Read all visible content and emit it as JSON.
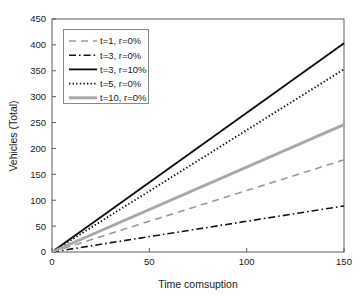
{
  "chart_data": {
    "type": "line",
    "title": "",
    "xlabel": "Time comsuption",
    "ylabel": "Vehicles (Total)",
    "xlim": [
      0,
      150
    ],
    "ylim": [
      0,
      450
    ],
    "xticks": [
      0,
      50,
      100,
      150
    ],
    "yticks": [
      0,
      50,
      100,
      150,
      200,
      250,
      300,
      350,
      400,
      450
    ],
    "xtick_labels": [
      "0",
      "50",
      "100",
      "150"
    ],
    "ytick_labels": [
      "0",
      "50",
      "100",
      "150",
      "200",
      "250",
      "300",
      "350",
      "400",
      "450"
    ],
    "grid": false,
    "legend_position": "upper left",
    "x": [
      0,
      150
    ],
    "series": [
      {
        "name": "t=1, r=0%",
        "values": [
          0,
          178
        ],
        "style": "dashed",
        "color": "#9a9a9a",
        "width": 1.6
      },
      {
        "name": "t=3, r=0%",
        "values": [
          0,
          89
        ],
        "style": "dashdot",
        "color": "#141414",
        "width": 1.6
      },
      {
        "name": "t=3, r=10%",
        "values": [
          0,
          403
        ],
        "style": "solid",
        "color": "#0a0a0a",
        "width": 1.8
      },
      {
        "name": "t=5, r=0%",
        "values": [
          0,
          353
        ],
        "style": "dotted",
        "color": "#141414",
        "width": 1.9
      },
      {
        "name": "t=10, r=0%",
        "values": [
          0,
          246
        ],
        "style": "solid",
        "color": "#a8a8a8",
        "width": 3.0
      }
    ]
  },
  "legend": {
    "entries": [
      {
        "label": "t=1, r=0%"
      },
      {
        "label": "t=3, r=0%"
      },
      {
        "label": "t=3, r=10%"
      },
      {
        "label": "t=5, r=0%"
      },
      {
        "label": "t=10, r=0%"
      }
    ]
  }
}
